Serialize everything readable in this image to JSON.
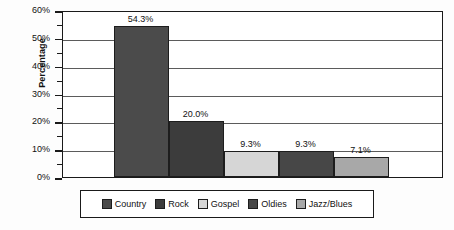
{
  "chart_data": {
    "type": "bar",
    "title": "",
    "xlabel": "",
    "ylabel": "Percentage",
    "categories": [
      "Country",
      "Rock",
      "Gospel",
      "Oldies",
      "Jazz/Blues"
    ],
    "values": [
      54.3,
      20.0,
      9.3,
      9.3,
      7.1
    ],
    "value_labels": [
      "54.3%",
      "20.0%",
      "9.3%",
      "9.3%",
      "7.1%"
    ],
    "ylim": [
      0,
      60
    ],
    "y_tick_labels": [
      "60%",
      "50%",
      "40%",
      "30%",
      "20%",
      "10%",
      "0%"
    ],
    "y_ticks": [
      60,
      50,
      40,
      30,
      20,
      10,
      0
    ],
    "y_minor_ticks": [
      55,
      45,
      35,
      25,
      15,
      5
    ],
    "grid": true,
    "legend_position": "bottom",
    "series_colors": [
      "#4b4b4b",
      "#3c3c3c",
      "#d6d6d6",
      "#474747",
      "#a8a8a8"
    ],
    "legend": [
      {
        "label": "Country",
        "color": "#4b4b4b"
      },
      {
        "label": "Rock",
        "color": "#3c3c3c"
      },
      {
        "label": "Gospel",
        "color": "#d6d6d6"
      },
      {
        "label": "Oldies",
        "color": "#474747"
      },
      {
        "label": "Jazz/Blues",
        "color": "#a8a8a8"
      }
    ]
  }
}
